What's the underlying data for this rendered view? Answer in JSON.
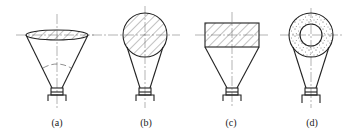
{
  "figure": {
    "panels": [
      {
        "id": "a",
        "label": "(a)",
        "head_shape": "lens-ellipse",
        "fill": "hatched"
      },
      {
        "id": "b",
        "label": "(b)",
        "head_shape": "circle",
        "fill": "hatched"
      },
      {
        "id": "c",
        "label": "(c)",
        "head_shape": "rectangle",
        "fill": "hatched"
      },
      {
        "id": "d",
        "label": "(d)",
        "head_shape": "annulus",
        "fill": "stippled"
      }
    ]
  },
  "colors": {
    "line": "#222222",
    "background": "#ffffff"
  }
}
